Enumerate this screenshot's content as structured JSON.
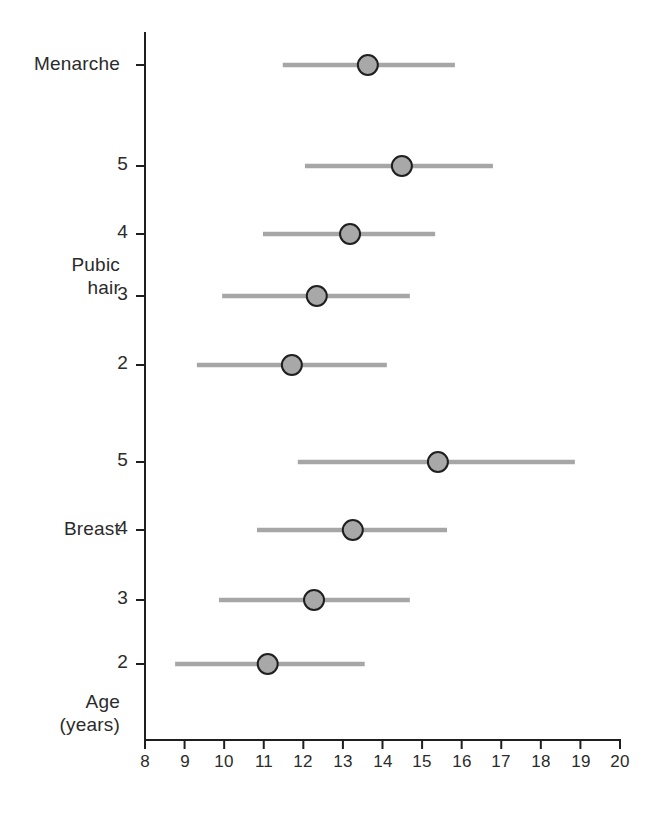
{
  "chart_data": {
    "type": "scatter",
    "title": "",
    "subtitle": "",
    "xlabel": "Age (years)",
    "ylabel": "",
    "xlim": [
      8,
      20
    ],
    "xticks": [
      8,
      9,
      10,
      11,
      12,
      13,
      14,
      15,
      16,
      17,
      18,
      19,
      20
    ],
    "xticklabels": [
      "8",
      "9",
      "10",
      "11",
      "12",
      "13",
      "14",
      "15",
      "16",
      "17",
      "18",
      "19",
      "20"
    ],
    "grid": false,
    "legend": null,
    "orientation": "horizontal",
    "marker": {
      "shape": "circle",
      "fill_color": "#a8a8a8",
      "edge_color": "#1f1f1f",
      "radius_px": 10
    },
    "range_line_color": "#a6a6a6",
    "axis_color": "#1f1f1f",
    "groups": [
      {
        "name": "Menarche",
        "label_lines": [
          "Menarche"
        ],
        "stage_label": "",
        "rows": [
          {
            "stage": "",
            "mean": 13.63,
            "range_low": 11.48,
            "range_high": 15.83
          }
        ]
      },
      {
        "name": "Pubic hair",
        "label_lines": [
          "Pubic",
          "hair"
        ],
        "stage_label": "",
        "rows": [
          {
            "stage": "5",
            "mean": 14.49,
            "range_low": 12.04,
            "range_high": 16.79
          },
          {
            "stage": "4",
            "mean": 13.18,
            "range_low": 10.98,
            "range_high": 15.33
          },
          {
            "stage": "3",
            "mean": 12.34,
            "range_low": 9.95,
            "range_high": 14.69
          },
          {
            "stage": "2",
            "mean": 11.71,
            "range_low": 9.31,
            "range_high": 14.11
          }
        ]
      },
      {
        "name": "Breast",
        "label_lines": [
          "Breast"
        ],
        "stage_label": "",
        "rows": [
          {
            "stage": "5",
            "mean": 15.4,
            "range_low": 11.86,
            "range_high": 18.86
          },
          {
            "stage": "4",
            "mean": 13.25,
            "range_low": 10.83,
            "range_high": 15.63
          },
          {
            "stage": "3",
            "mean": 12.27,
            "range_low": 9.87,
            "range_high": 14.69
          },
          {
            "stage": "2",
            "mean": 11.1,
            "range_low": 8.76,
            "range_high": 13.55
          }
        ]
      }
    ],
    "series": [
      {
        "name": "Tanner stage ranges",
        "points": [
          {
            "category": "Menarche",
            "mean": 13.63,
            "low": 11.48,
            "high": 15.83
          },
          {
            "category": "Pubic hair 5",
            "mean": 14.49,
            "low": 12.04,
            "high": 16.79
          },
          {
            "category": "Pubic hair 4",
            "mean": 13.18,
            "low": 10.98,
            "high": 15.33
          },
          {
            "category": "Pubic hair 3",
            "mean": 12.34,
            "low": 9.95,
            "high": 14.69
          },
          {
            "category": "Pubic hair 2",
            "mean": 11.71,
            "low": 9.31,
            "high": 14.11
          },
          {
            "category": "Breast 5",
            "mean": 15.4,
            "low": 11.86,
            "high": 18.86
          },
          {
            "category": "Breast 4",
            "mean": 13.25,
            "low": 10.83,
            "high": 15.63
          },
          {
            "category": "Breast 3",
            "mean": 12.27,
            "low": 9.87,
            "high": 14.69
          },
          {
            "category": "Breast 2",
            "mean": 11.1,
            "low": 8.76,
            "high": 13.55
          }
        ]
      }
    ]
  },
  "labels": {
    "menarche": "Menarche",
    "pubic_hair_line1": "Pubic",
    "pubic_hair_line2": "hair",
    "breast": "Breast",
    "age_line1": "Age",
    "age_line2": "(years)",
    "stage_ph_5": "5",
    "stage_ph_4": "4",
    "stage_ph_3": "3",
    "stage_ph_2": "2",
    "stage_b_5": "5",
    "stage_b_4": "4",
    "stage_b_3": "3",
    "stage_b_2": "2"
  },
  "axis": {
    "tick_8": "8",
    "tick_9": "9",
    "tick_10": "10",
    "tick_11": "11",
    "tick_12": "12",
    "tick_13": "13",
    "tick_14": "14",
    "tick_15": "15",
    "tick_16": "16",
    "tick_17": "17",
    "tick_18": "18",
    "tick_19": "19",
    "tick_20": "20"
  }
}
